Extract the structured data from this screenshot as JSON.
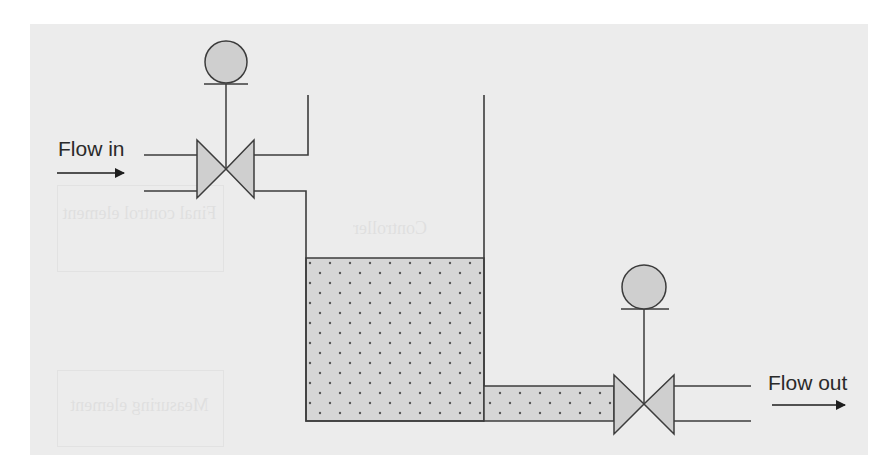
{
  "diagram": {
    "labels": {
      "flow_in": "Flow in",
      "flow_out": "Flow out"
    },
    "components": [
      {
        "id": "inlet-control-valve",
        "type": "control-valve",
        "actuator": "diaphragm"
      },
      {
        "id": "tank",
        "type": "open-tank",
        "content": "liquid"
      },
      {
        "id": "outlet-control-valve",
        "type": "control-valve",
        "actuator": "diaphragm"
      }
    ],
    "bleed_through_text": {
      "final_control_element": "Final control element",
      "controller": "Controller",
      "measuring_element": "Measuring element"
    },
    "colors": {
      "panel_background": "#ececec",
      "line": "#3c3c3c",
      "fill": "#cfcfcf",
      "liquid_fill": "#d6d6d6",
      "liquid_dots": "#555555",
      "text": "#2a2a2a"
    }
  }
}
